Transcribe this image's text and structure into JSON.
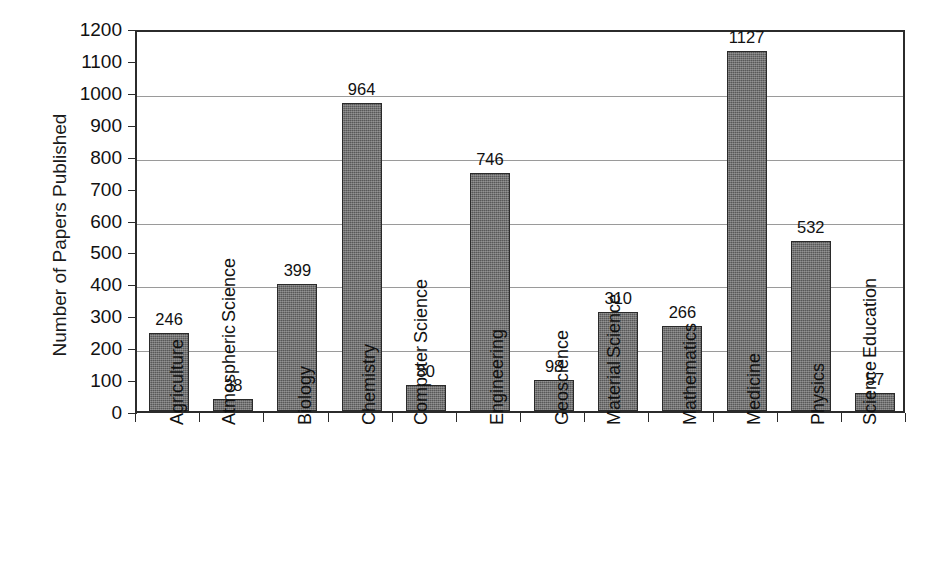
{
  "chart_data": {
    "type": "bar",
    "title": "",
    "xlabel": "",
    "ylabel": "Number of Papers Published",
    "ylim": [
      0,
      1200
    ],
    "ytick_step": 100,
    "gridline_step": 200,
    "grid": true,
    "legend": "none",
    "categories": [
      "Agriculture",
      "Atmospheric Science",
      "Biology",
      "Chemistry",
      "Computer Science",
      "Engineering",
      "Geoscience",
      "Material Science",
      "Mathematics",
      "Medicine",
      "Physics",
      "Science Education"
    ],
    "category_lines": [
      [
        "Agriculture"
      ],
      [
        "Atmospheric",
        "Science"
      ],
      [
        "Biology"
      ],
      [
        "Chemistry"
      ],
      [
        "Computer",
        "Science"
      ],
      [
        "Engineering"
      ],
      [
        "Geoscience"
      ],
      [
        "Material",
        "Science"
      ],
      [
        "Mathematics"
      ],
      [
        "Medicine"
      ],
      [
        "Physics"
      ],
      [
        "Science",
        "Education"
      ]
    ],
    "values": [
      246,
      38,
      399,
      964,
      80,
      746,
      98,
      310,
      266,
      1127,
      532,
      57
    ],
    "value_labels": [
      "246",
      "38",
      "399",
      "964",
      "80",
      "746",
      "98",
      "310",
      "266",
      "1127",
      "532",
      "57"
    ],
    "ytick_labels": [
      "1200",
      "1100",
      "1000",
      "900",
      "800",
      "700",
      "600",
      "500",
      "400",
      "300",
      "200",
      "100",
      "0"
    ],
    "ytick_values": [
      1200,
      1100,
      1000,
      900,
      800,
      700,
      600,
      500,
      400,
      300,
      200,
      100,
      0
    ],
    "gridline_values": [
      1000,
      800,
      600,
      400,
      200
    ],
    "bar_color": "#585858",
    "bar_edge_color": "#2a2a2a",
    "grid_color": "#9a9a9a",
    "axis_color": "#2b2b2b",
    "background_color": "#ffffff"
  }
}
